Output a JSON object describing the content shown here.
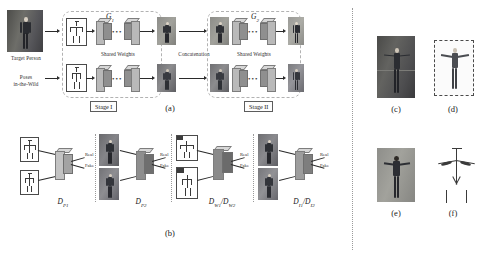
{
  "figure": {
    "caption_a": "(a)",
    "caption_b": "(b)",
    "caption_c": "(c)",
    "caption_d": "(d)",
    "caption_e": "(e)",
    "caption_f": "(f)"
  },
  "panel_a": {
    "input_target_label": "Target Person",
    "input_poses_label": "Poses\nin-the-Wild",
    "input_poses_line1": "Poses",
    "input_poses_line2": "in-the-Wild",
    "generator_1": "G",
    "generator_1_sub": "1",
    "generator_2": "G",
    "generator_2_sub": "2",
    "shared_weights_1": "Shared Weights",
    "shared_weights_2": "Shared Weights",
    "concatenation": "Concatenation",
    "stage_1": "Stage I",
    "stage_2": "Stage II"
  },
  "panel_b": {
    "discriminators": [
      {
        "name": "D",
        "sub": "P1",
        "sub_html": "P₁",
        "real": "Real",
        "fake": "Fake"
      },
      {
        "name": "D",
        "sub": "P2",
        "sub_html": "P₂",
        "real": "Real",
        "fake": "Fake"
      },
      {
        "name": "D",
        "sub": "W1/W2",
        "sub_html": "W₁/W₂",
        "real": "Real",
        "fake": "Fake"
      },
      {
        "name": "D",
        "sub": "I1/I2",
        "sub_html": "I₁/I₂",
        "real": "Real",
        "fake": "Fake"
      }
    ],
    "d_p1_label": "D",
    "d_p1_sub": "P1",
    "d_p2_label": "D",
    "d_p2_sub": "P2",
    "d_w_label": "D",
    "d_w_sub1": "W1",
    "d_w_sub2": "W2",
    "d_i_label": "D",
    "d_i_sub1": "I1",
    "d_i_sub2": "I2",
    "slash": "/",
    "real": "Real",
    "fake": "Fake"
  },
  "panel_right": {
    "item_c_desc": "target person photograph in dim indoor scene",
    "item_d_desc": "generated person on dashed-border canvas",
    "item_e_desc": "generated person photograph, arms out",
    "item_f_desc": "stick-figure pose skeleton"
  },
  "colors": {
    "ink": "#1a1a1a",
    "slab_face": "#b9b9b9",
    "slab_top": "#d7d7d7",
    "slab_side": "#8f8f8f",
    "dashed_border": "#b2b2b2",
    "separator": "#8d8d8d",
    "photo_bg_dark": "#6f6f6b",
    "photo_bg_light": "#9a9a96",
    "body_dark": "#2f3136"
  },
  "icons": {
    "arrow": "arrow-right-icon",
    "ellipsis": "ellipsis-icon"
  }
}
